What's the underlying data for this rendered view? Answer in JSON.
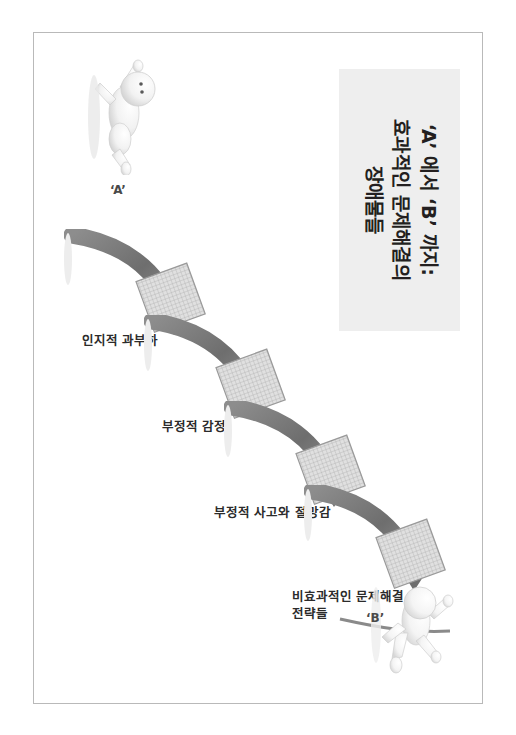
{
  "slide": {
    "title": {
      "line1": "‘A’ 에서 ‘B’ 까지:",
      "line2": "효과적인 문제해결의",
      "line3": "장애물들"
    },
    "endpoints": {
      "start_label": "‘A’",
      "end_label": "‘B’"
    },
    "steps": [
      {
        "id": "step-1",
        "label": "인지적 과부하"
      },
      {
        "id": "step-2",
        "label": "부정적 감정"
      },
      {
        "id": "step-3",
        "label": "부정적 사고와 절망감"
      },
      {
        "id": "step-4",
        "label_line1": "비효과적인 문제해결",
        "label_line2": "전략들"
      }
    ],
    "icons": {
      "start_figure": "person-crawling-figure-icon",
      "end_figure": "person-with-flag-figure-icon",
      "barrier": "hurdle-mesh-barrier-icon",
      "arrow": "curved-arrow-icon"
    },
    "colors": {
      "title_background": "#eeeeee",
      "title_text": "#231f20",
      "arrow_dark": "#6f6f6f",
      "arrow_light": "#a9a9a9",
      "barrier_fill": "#d7d7d7",
      "page_border": "#b9b9b9",
      "label_text": "#2b2b2b"
    }
  }
}
